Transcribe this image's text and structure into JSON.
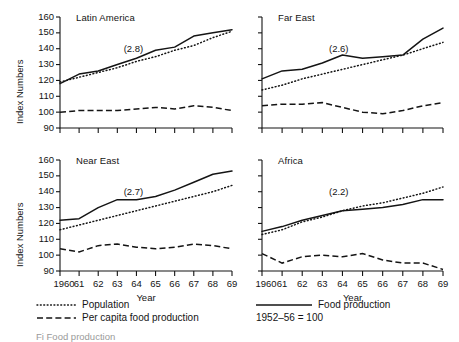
{
  "figure": {
    "note": "1952–56 = 100",
    "xlabel": "Year",
    "ylabel": "Index Numbers",
    "caption_fragment": "Fi        Food production"
  },
  "legend": {
    "items": [
      {
        "key": "population",
        "label": "Population",
        "style": "dotted"
      },
      {
        "key": "per-capita-food-production",
        "label": "Per capita food production",
        "style": "dashed"
      },
      {
        "key": "food-production",
        "label": "Food production",
        "style": "solid"
      }
    ],
    "base_note": "1952–56 = 100"
  },
  "axes": {
    "y_ticks": [
      90,
      100,
      110,
      120,
      130,
      140,
      150,
      160
    ],
    "y_tick_labels": [
      "90",
      "100",
      "110",
      "120",
      "130",
      "140",
      "150",
      "160"
    ],
    "ylim": [
      90,
      160
    ],
    "x_ticks": [
      1960,
      1961,
      1962,
      1963,
      1964,
      1965,
      1966,
      1967,
      1968,
      1969
    ],
    "x_tick_labels": [
      "1960",
      "61",
      "62",
      "63",
      "64",
      "65",
      "66",
      "67",
      "68",
      "69"
    ],
    "xlim": [
      1960,
      1969
    ],
    "grid": false
  },
  "chart_data": {
    "type": "line",
    "title": "",
    "subtitle": "1952–56 = 100",
    "xlabel": "Year",
    "ylabel": "Index Numbers",
    "xlim": [
      1960,
      1969
    ],
    "ylim": [
      90,
      160
    ],
    "grid": false,
    "legend_position": "bottom",
    "x": [
      1960,
      1961,
      1962,
      1963,
      1964,
      1965,
      1966,
      1967,
      1968,
      1969
    ],
    "panels": [
      {
        "name": "Latin America",
        "annotation": "(2.8)",
        "annotation_meaning": "population growth rate, percent per year",
        "series": [
          {
            "name": "Food production",
            "style": "solid",
            "values": [
              118,
              124,
              126,
              130,
              134,
              139,
              141,
              148,
              150,
              152
            ]
          },
          {
            "name": "Population",
            "style": "dotted",
            "values": [
              119,
              122,
              125,
              128,
              132,
              135,
              139,
              142,
              147,
              151
            ]
          },
          {
            "name": "Per capita food production",
            "style": "dashed",
            "values": [
              100,
              101,
              101,
              101,
              102,
              103,
              102,
              104,
              103,
              101
            ]
          }
        ]
      },
      {
        "name": "Far East",
        "annotation": "(2.6)",
        "annotation_meaning": "population growth rate, percent per year",
        "series": [
          {
            "name": "Food production",
            "style": "solid",
            "values": [
              121,
              126,
              127,
              131,
              136,
              134,
              135,
              136,
              146,
              153
            ]
          },
          {
            "name": "Population",
            "style": "dotted",
            "values": [
              114,
              117,
              121,
              124,
              127,
              130,
              133,
              136,
              140,
              144
            ]
          },
          {
            "name": "Per capita food production",
            "style": "dashed",
            "values": [
              104,
              105,
              105,
              106,
              103,
              100,
              99,
              101,
              104,
              106
            ]
          }
        ]
      },
      {
        "name": "Near East",
        "annotation": "(2.7)",
        "annotation_meaning": "population growth rate, percent per year",
        "series": [
          {
            "name": "Food production",
            "style": "solid",
            "values": [
              122,
              123,
              130,
              135,
              135,
              137,
              141,
              146,
              151,
              153
            ]
          },
          {
            "name": "Population",
            "style": "dotted",
            "values": [
              116,
              119,
              122,
              125,
              128,
              131,
              134,
              137,
              140,
              144
            ]
          },
          {
            "name": "Per capita food production",
            "style": "dashed",
            "values": [
              104,
              102,
              106,
              107,
              105,
              104,
              105,
              107,
              106,
              104
            ]
          }
        ]
      },
      {
        "name": "Africa",
        "annotation": "(2.2)",
        "annotation_meaning": "population growth rate, percent per year",
        "series": [
          {
            "name": "Food production",
            "style": "solid",
            "values": [
              115,
              118,
              122,
              125,
              128,
              129,
              130,
              132,
              135,
              135
            ]
          },
          {
            "name": "Population",
            "style": "dotted",
            "values": [
              113,
              116,
              121,
              124,
              128,
              131,
              133,
              136,
              139,
              143
            ]
          },
          {
            "name": "Per capita food production",
            "style": "dashed",
            "values": [
              101,
              95,
              99,
              100,
              99,
              101,
              97,
              95,
              95,
              91
            ]
          }
        ]
      }
    ]
  }
}
